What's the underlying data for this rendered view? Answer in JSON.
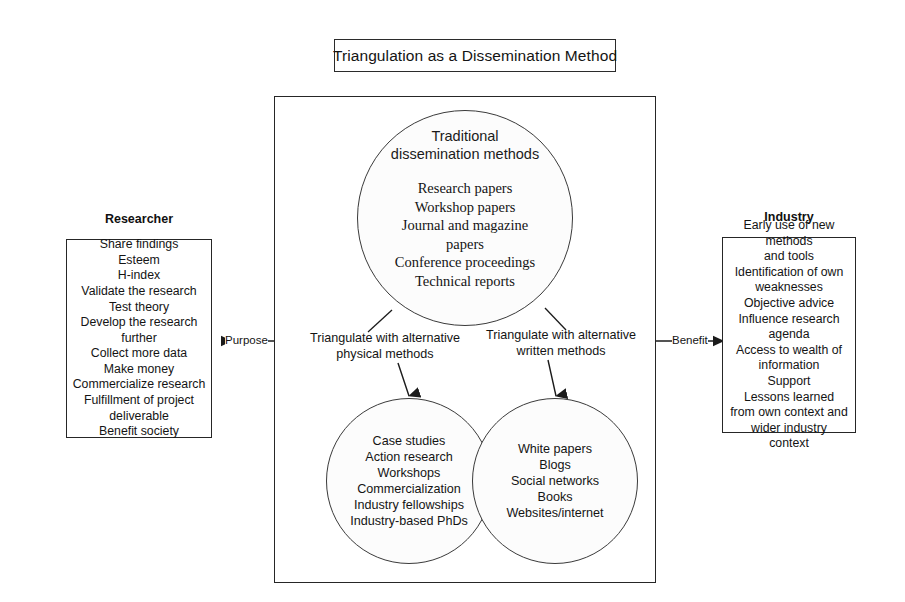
{
  "title": {
    "text": "Triangulation as a Dissemination Method"
  },
  "center": {
    "traditional_circle": {
      "heading": "Traditional\ndissemination methods",
      "items": [
        "Research papers",
        "Workshop papers",
        "Journal and magazine",
        "papers",
        "Conference proceedings",
        "Technical reports"
      ]
    },
    "branch_labels": {
      "left": "Triangulate with alternative\nphysical methods",
      "right": "Triangulate with alternative\nwritten methods"
    },
    "physical_circle": {
      "items": [
        "Case studies",
        "Action research",
        "Workshops",
        "Commercialization",
        "Industry fellowships",
        "Industry-based PhDs"
      ]
    },
    "written_circle": {
      "items": [
        "White papers",
        "Blogs",
        "Social networks",
        "Books",
        "Websites/internet"
      ]
    }
  },
  "left_panel": {
    "heading": "Researcher",
    "connector_label": "Purpose",
    "items": [
      "Share findings",
      "Esteem",
      "H-index",
      "Validate the research",
      "Test theory",
      "Develop the research further",
      "Collect more data",
      "Make money",
      "Commercialize research",
      "Fulfillment of project",
      "deliverable",
      "Benefit society"
    ]
  },
  "right_panel": {
    "heading": "Industry",
    "connector_label": "Benefit",
    "items": [
      "Early use of new methods",
      "and tools",
      "Identification of own",
      "weaknesses",
      "Objective advice",
      "Influence research agenda",
      "Access to wealth of",
      "information",
      "Support",
      "Lessons learned",
      "from own context and",
      "wider industry",
      "context"
    ]
  },
  "colors": {
    "stroke": "#262626",
    "text": "#141414",
    "background": "#ffffff"
  }
}
